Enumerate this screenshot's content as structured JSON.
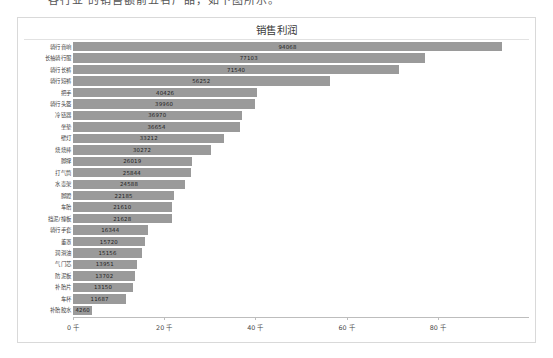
{
  "caption": {
    "text": "各行业  的销售额前五名产品，如下图所示。"
  },
  "panel": {
    "title": "销售利润",
    "bar_color": "#9a9a9a",
    "border_color": "#d9d9d9"
  },
  "chart_data": {
    "type": "bar",
    "orientation": "horizontal",
    "title": "销售利润",
    "xlabel": "",
    "ylabel": "",
    "xlim": [
      0,
      100000
    ],
    "grid": false,
    "legend": false,
    "axis_tick_labels": [
      "0 千",
      "20 千",
      "40 千",
      "60 千",
      "80 千"
    ],
    "axis_tick_values": [
      0,
      20000,
      40000,
      60000,
      80000
    ],
    "categories": [
      "骑行音响",
      "长袖骑行服",
      "骑行长裤",
      "骑行短裤",
      "把手",
      "骑行头盔",
      "冷链器",
      "坐垫",
      "壁灯",
      "烧烧棒",
      "脚撑",
      "打气筒",
      "水壶架",
      "脚蹬",
      "车胎",
      "挡泥/撞板",
      "骑行手套",
      "董罩",
      "润滑油",
      "气门芯",
      "防泥板",
      "补胎片",
      "车杯",
      "补胎胶水"
    ],
    "values": [
      94068,
      77103,
      71540,
      56252,
      40426,
      39960,
      36970,
      36654,
      33212,
      30272,
      26019,
      25844,
      24588,
      22185,
      21610,
      21628,
      16344,
      15720,
      15156,
      13951,
      13702,
      13150,
      11687,
      4260
    ]
  }
}
